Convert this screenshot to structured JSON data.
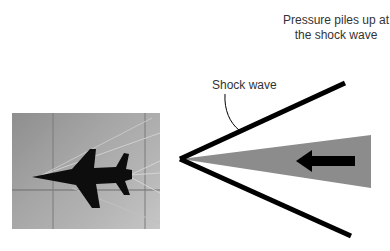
{
  "labels": {
    "pressure": "Pressure piles up at the shock wave",
    "shock_wave": "Shock wave"
  },
  "figure": {
    "photo": "schlieren-photo-of-supersonic-jet",
    "diagram": "shock-wave-cone-with-pressure-wedge-and-flow-arrow"
  },
  "colors": {
    "shock_line": "#000000",
    "wedge": "#8c8c8c",
    "arrow": "#000000",
    "text": "#333333"
  }
}
